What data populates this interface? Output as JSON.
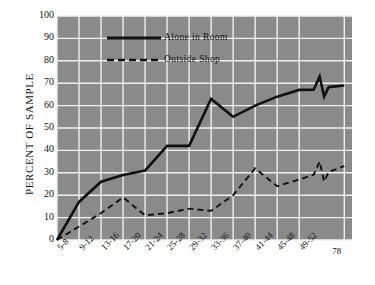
{
  "chart_data": {
    "type": "line",
    "title": "",
    "xlabel": "",
    "ylabel": "PERCENT OF SAMPLE",
    "ylim": [
      0,
      100
    ],
    "yticks": [
      0,
      10,
      20,
      30,
      40,
      50,
      60,
      70,
      80,
      90,
      100
    ],
    "grid": true,
    "legend_position": "upper-left-inside",
    "categories": [
      "5-8",
      "9-12",
      "13-16",
      "17-20",
      "21-24",
      "25-28",
      "29-32",
      "33-36",
      "37-40",
      "41-44",
      "45-48",
      "49-52",
      "78"
    ],
    "series": [
      {
        "name": "Alone in Room",
        "style": "solid",
        "color": "#111111",
        "values": [
          0,
          17,
          26,
          29,
          31,
          42,
          42,
          63,
          55,
          60,
          64,
          67,
          69
        ]
      },
      {
        "name": "Outside Shop",
        "style": "dashed",
        "color": "#111111",
        "values": [
          0,
          6,
          12,
          19,
          11,
          12,
          14,
          13,
          20,
          32,
          24,
          27,
          33
        ]
      }
    ],
    "axis_break": {
      "present": true,
      "between": [
        "49-52",
        "78"
      ],
      "note": "zigzag break marker drawn on both lines near right edge"
    }
  },
  "legend": {
    "items": [
      {
        "label": "Alone in Room",
        "style": "solid"
      },
      {
        "label": "Outside Shop",
        "style": "dashed"
      }
    ]
  },
  "colors": {
    "plot_background": "#8a8a8a",
    "gridline": "#f0f0f0",
    "line": "#111111",
    "page_background": "#ffffff",
    "text": "#111111"
  }
}
